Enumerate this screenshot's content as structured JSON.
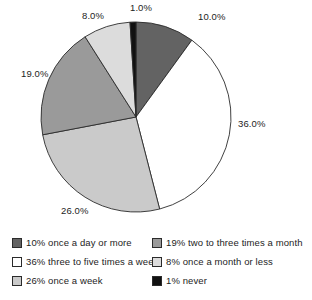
{
  "chart_data": {
    "type": "pie",
    "title": "",
    "subtitle": "",
    "xlabel": "",
    "ylabel": "",
    "grid": false,
    "legend_position": "bottom",
    "start_angle_deg": 90,
    "direction": "clockwise",
    "categories": [
      "once a day or more",
      "three to five times a week",
      "once a week",
      "two to three times a month",
      "once a month or less",
      "never"
    ],
    "values": [
      10,
      36,
      26,
      19,
      8,
      1
    ],
    "slices": [
      {
        "label": "once a day or more",
        "value": 10,
        "data_label": "10.0%",
        "legend_label": "10% once a day or more",
        "color": "#636363"
      },
      {
        "label": "three to five times a week",
        "value": 36,
        "data_label": "36.0%",
        "legend_label": "36% three to five times a week",
        "color": "#ffffff"
      },
      {
        "label": "once a week",
        "value": 26,
        "data_label": "26.0%",
        "legend_label": "26% once a week",
        "color": "#cacaca"
      },
      {
        "label": "two to three times a month",
        "value": 19,
        "data_label": "19.0%",
        "legend_label": "19% two to three times a month",
        "color": "#9a9a9a"
      },
      {
        "label": "once a month or less",
        "value": 8,
        "data_label": "8.0%",
        "legend_label": "8% once a month or less",
        "color": "#dcdcdc"
      },
      {
        "label": "never",
        "value": 1,
        "data_label": "1.0%",
        "legend_label": "1% never",
        "color": "#111111"
      }
    ]
  },
  "legend": {
    "left_column": [
      "10% once a day or more",
      "36% three to five times a week",
      "26% once a week"
    ],
    "right_column": [
      "19% two to three times a month",
      "8% once a month or less",
      "1% never"
    ]
  },
  "labels": {
    "l10": "10.0%",
    "l36": "36.0%",
    "l26": "26.0%",
    "l19": "19.0%",
    "l8": "8.0%",
    "l1": "1.0%"
  },
  "colors": {
    "slice_10": "#636363",
    "slice_36": "#ffffff",
    "slice_26": "#cacaca",
    "slice_19": "#9a9a9a",
    "slice_8": "#dcdcdc",
    "slice_1": "#111111",
    "outline": "#2b2b2b",
    "text": "#1d1d1d"
  }
}
